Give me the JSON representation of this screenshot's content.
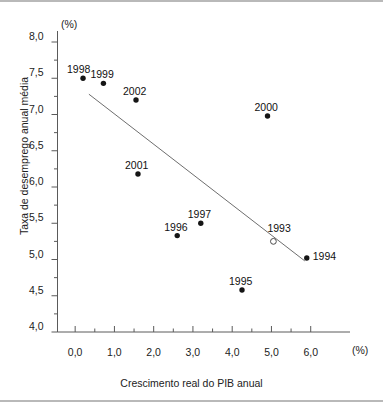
{
  "figure": {
    "unit_y": "(%)",
    "unit_x": "(%)",
    "xlabel": "Crescimento real do PIB anual",
    "ylabel": "Taxa de desemprego anual média"
  },
  "chart_data": {
    "type": "scatter",
    "title": "",
    "xlabel": "Crescimento real do PIB anual",
    "ylabel": "Taxa de desemprego anual média",
    "x_unit": "(%)",
    "y_unit": "(%)",
    "xlim": [
      -0.45,
      6.95
    ],
    "ylim": [
      4.0,
      8.0
    ],
    "xticks": [
      0.0,
      1.0,
      2.0,
      3.0,
      4.0,
      5.0,
      6.0
    ],
    "xtick_labels": [
      "0,0",
      "1,0",
      "2,0",
      "3,0",
      "4,0",
      "5,0",
      "6,0"
    ],
    "yticks": [
      4.0,
      4.5,
      5.0,
      5.5,
      6.0,
      6.5,
      7.0,
      7.5,
      8.0
    ],
    "ytick_labels": [
      "4,0",
      "4,5",
      "5,0",
      "5,5",
      "6,0",
      "6,5",
      "7,0",
      "7,5",
      "8,0"
    ],
    "grid": false,
    "legend": false,
    "points": [
      {
        "label": "1998",
        "x": 0.2,
        "y": 7.5,
        "marker": "filled",
        "label_pos": "above-left"
      },
      {
        "label": "1999",
        "x": 0.72,
        "y": 7.43,
        "marker": "filled",
        "label_pos": "above"
      },
      {
        "label": "2002",
        "x": 1.55,
        "y": 7.2,
        "marker": "filled",
        "label_pos": "above"
      },
      {
        "label": "2000",
        "x": 4.9,
        "y": 6.98,
        "marker": "filled",
        "label_pos": "above"
      },
      {
        "label": "2001",
        "x": 1.6,
        "y": 6.18,
        "marker": "filled",
        "label_pos": "above"
      },
      {
        "label": "1997",
        "x": 3.2,
        "y": 5.5,
        "marker": "filled",
        "label_pos": "above"
      },
      {
        "label": "1996",
        "x": 2.6,
        "y": 5.33,
        "marker": "filled",
        "label_pos": "above"
      },
      {
        "label": "1993",
        "x": 5.05,
        "y": 5.25,
        "marker": "hollow",
        "label_pos": "above-right"
      },
      {
        "label": "1994",
        "x": 5.9,
        "y": 5.02,
        "marker": "filled",
        "label_pos": "right"
      },
      {
        "label": "1995",
        "x": 4.25,
        "y": 4.58,
        "marker": "filled",
        "label_pos": "above"
      }
    ],
    "trendline": {
      "x0": 0.35,
      "y0": 7.28,
      "x1": 5.85,
      "y1": 4.98
    }
  }
}
